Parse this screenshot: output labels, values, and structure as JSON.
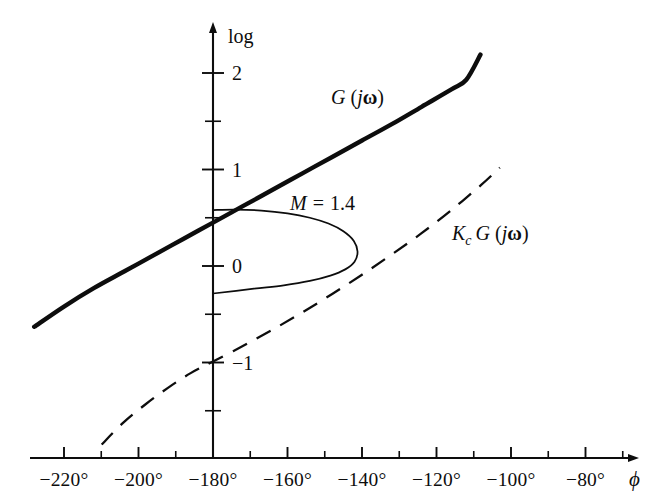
{
  "figure": {
    "background_color": "#ffffff",
    "ink_color": "#0d0d0d"
  },
  "axes": {
    "x": {
      "name": "ϕ",
      "unit": "degrees",
      "tick_labels": [
        "−220°",
        "−200°",
        "−180°",
        "−160°",
        "−140°",
        "−120°",
        "−100°",
        "−80°"
      ],
      "tick_values": [
        -220,
        -200,
        -180,
        -160,
        -140,
        -120,
        -100,
        -80
      ],
      "minor_tick_values": [
        -210,
        -190,
        -170,
        -150,
        -130,
        -110,
        -90,
        -70
      ],
      "range": [
        -232,
        -68
      ],
      "arrow": true
    },
    "y": {
      "name": "log",
      "tick_labels": [
        "2",
        "1",
        "0",
        "−1"
      ],
      "tick_values": [
        2,
        1,
        0,
        -1
      ],
      "minor_tick_values": [
        1.5,
        0.5,
        -0.5,
        -1.5
      ],
      "range": [
        -1.85,
        2.5
      ],
      "arrow": true
    }
  },
  "chart_data": {
    "type": "line",
    "xlabel": "ϕ",
    "ylabel": "log",
    "xlim": [
      -232,
      -68
    ],
    "ylim": [
      -1.85,
      2.5
    ],
    "grid": false,
    "legend": "inline-annotations",
    "series": [
      {
        "name": "G (jω)",
        "label": "G (jω)",
        "style": "solid-heavy",
        "points": [
          [
            -228.0,
            -0.63
          ],
          [
            -220.0,
            -0.42
          ],
          [
            -212.0,
            -0.23
          ],
          [
            -204.0,
            -0.06
          ],
          [
            -196.0,
            0.11
          ],
          [
            -188.0,
            0.28
          ],
          [
            -180.0,
            0.45
          ],
          [
            -172.0,
            0.62
          ],
          [
            -164.0,
            0.79
          ],
          [
            -156.0,
            0.96
          ],
          [
            -148.0,
            1.13
          ],
          [
            -140.0,
            1.3
          ],
          [
            -132.0,
            1.47
          ],
          [
            -124.0,
            1.65
          ],
          [
            -116.0,
            1.83
          ],
          [
            -112.0,
            1.93
          ],
          [
            -108.2,
            2.19
          ]
        ]
      },
      {
        "name": "Kc G (jω)",
        "label": "K_c G (jω)",
        "style": "dashed",
        "points": [
          [
            -209.9,
            -1.85
          ],
          [
            -204.0,
            -1.62
          ],
          [
            -198.0,
            -1.43
          ],
          [
            -192.0,
            -1.26
          ],
          [
            -186.0,
            -1.11
          ],
          [
            -180.0,
            -0.99
          ],
          [
            -172.0,
            -0.83
          ],
          [
            -164.0,
            -0.66
          ],
          [
            -156.0,
            -0.48
          ],
          [
            -148.0,
            -0.29
          ],
          [
            -140.0,
            -0.09
          ],
          [
            -132.0,
            0.12
          ],
          [
            -124.0,
            0.34
          ],
          [
            -116.0,
            0.58
          ],
          [
            -108.0,
            0.84
          ],
          [
            -103.0,
            1.02
          ]
        ]
      },
      {
        "name": "M contour",
        "label": "M = 1.4",
        "value": 1.4,
        "style": "thin-contour",
        "points": [
          [
            -180.0,
            0.58
          ],
          [
            -174.0,
            0.585
          ],
          [
            -167.0,
            0.575
          ],
          [
            -160.0,
            0.545
          ],
          [
            -154.0,
            0.5
          ],
          [
            -149.0,
            0.44
          ],
          [
            -145.0,
            0.36
          ],
          [
            -142.2,
            0.26
          ],
          [
            -141.2,
            0.15
          ],
          [
            -142.0,
            0.045
          ],
          [
            -144.5,
            -0.035
          ],
          [
            -148.5,
            -0.1
          ],
          [
            -154.0,
            -0.155
          ],
          [
            -161.0,
            -0.2
          ],
          [
            -169.0,
            -0.235
          ],
          [
            -180.0,
            -0.285
          ]
        ]
      }
    ],
    "annotations": [
      {
        "name": "label-G",
        "text": "G (jω)",
        "x": -166.5,
        "y": 1.72
      },
      {
        "name": "label-M",
        "text": "M = 1.4",
        "x": -172.0,
        "y": 0.73
      },
      {
        "name": "label-KcG",
        "text": "K_c G (jω)",
        "x": -129.0,
        "y": 0.45
      }
    ]
  },
  "labels": {
    "y_axis_name": "log",
    "x_axis_name": "ϕ",
    "series_G": {
      "main": "G",
      "open": "(",
      "j": "j",
      "omega": "ω",
      "close": ")"
    },
    "series_KcG": {
      "K": "K",
      "sub": "c",
      "G": "G",
      "open": "(",
      "j": "j",
      "omega": "ω",
      "close": ")"
    },
    "m_contour": {
      "M": "M",
      "eq": "=",
      "value": "1.4"
    }
  }
}
